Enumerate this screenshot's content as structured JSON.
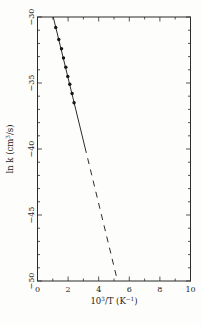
{
  "figure": {
    "background": "#fdfdfb"
  },
  "chart_data": {
    "type": "scatter",
    "title": "",
    "xlabel": "10^{3}/T (K^{−1})",
    "ylabel": "ln k (cm^{3}/s)",
    "xlim": [
      0,
      10
    ],
    "ylim": [
      -50,
      -30
    ],
    "x_major_ticks": [
      0,
      2,
      4,
      6,
      8,
      10
    ],
    "x_tick_labels": [
      "0",
      "2",
      "4",
      "6",
      "8",
      "10"
    ],
    "x_minor_step": 1,
    "y_major_ticks": [
      -30,
      -35,
      -40,
      -45,
      -50
    ],
    "y_tick_labels": [
      "−30",
      "−35",
      "−40",
      "−45",
      "−50"
    ],
    "y_minor_step": 1,
    "grid": false,
    "legend": null,
    "frame": "box-with-inward-ticks",
    "series": [
      {
        "name": "measured-rate-constants",
        "kind": "scatter",
        "marker": "filled-circle",
        "points": [
          [
            1.19,
            -30.8
          ],
          [
            1.39,
            -31.7
          ],
          [
            1.57,
            -32.4
          ],
          [
            1.7,
            -33.1
          ],
          [
            1.85,
            -33.8
          ],
          [
            1.98,
            -34.5
          ],
          [
            2.11,
            -35.1
          ],
          [
            2.26,
            -35.8
          ],
          [
            2.39,
            -36.5
          ]
        ]
      },
      {
        "name": "arrhenius-fit-solid",
        "kind": "line",
        "style": "solid",
        "x_start": 1.03,
        "x_end": 3.1
      },
      {
        "name": "arrhenius-extrapolation-dashed",
        "kind": "line",
        "style": "dashed",
        "x_start": 3.1,
        "x_end": 5.23
      }
    ],
    "fit": {
      "slope": -4.76,
      "intercept": -25.1
    },
    "colors": {
      "axis": "#2b2b2b",
      "line": "#2b2b2b",
      "marker": "#141414",
      "background": "#fdfdfb"
    }
  }
}
